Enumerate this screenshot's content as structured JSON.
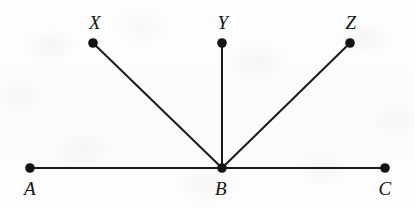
{
  "figure": {
    "type": "geometry-diagram",
    "width": 414,
    "height": 209,
    "background_color": "#fdfdfd",
    "ink_color": "#1a1a1a",
    "line_width": 2,
    "dot_radius": 4.6,
    "points": [
      {
        "id": "A",
        "label": "A",
        "x": 30,
        "y": 168,
        "label_x": 30,
        "label_y": 179,
        "label_position": "below"
      },
      {
        "id": "B",
        "label": "B",
        "x": 222,
        "y": 168,
        "label_x": 221,
        "label_y": 179,
        "label_position": "below"
      },
      {
        "id": "C",
        "label": "C",
        "x": 385,
        "y": 168,
        "label_x": 385,
        "label_y": 179,
        "label_position": "below"
      },
      {
        "id": "X",
        "label": "X",
        "x": 93,
        "y": 43,
        "label_x": 95,
        "label_y": 13,
        "label_position": "above"
      },
      {
        "id": "Y",
        "label": "Y",
        "x": 222,
        "y": 43,
        "label_x": 223,
        "label_y": 13,
        "label_position": "above"
      },
      {
        "id": "Z",
        "label": "Z",
        "x": 350,
        "y": 43,
        "label_x": 351,
        "label_y": 13,
        "label_position": "above"
      }
    ],
    "segments": [
      {
        "id": "AC",
        "name": "line-a-c",
        "from": "A",
        "to": "C"
      },
      {
        "id": "BX",
        "name": "ray-b-x",
        "from": "B",
        "to": "X"
      },
      {
        "id": "BY",
        "name": "ray-b-y",
        "from": "B",
        "to": "Y"
      },
      {
        "id": "BZ",
        "name": "ray-b-z",
        "from": "B",
        "to": "Z"
      }
    ]
  }
}
